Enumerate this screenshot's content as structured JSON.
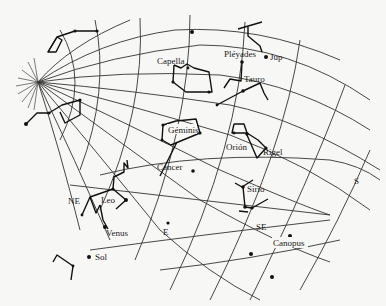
{
  "diagram": {
    "type": "star-chart",
    "background": "#f7f7f5",
    "ink": "#222222",
    "labels": {
      "capella": "Capella",
      "pleyades": "Pléyades",
      "jup": "Jup",
      "tauro": "Tauro",
      "geminis": "Géminis",
      "orion": "Orión",
      "rigel": "Rigel",
      "cancer": "Cancer",
      "sirio": "Sirio",
      "leo": "Leo",
      "ne": "NE",
      "venus": "Venus",
      "e": "E",
      "se": "SE",
      "s": "S",
      "canopus": "Canopus",
      "sol": "Sol"
    }
  }
}
